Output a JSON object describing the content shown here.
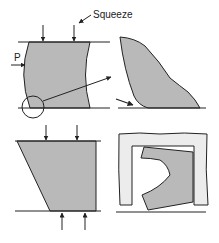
{
  "labels": {
    "squeeze": "Squeeze",
    "force_p": "P"
  },
  "colors": {
    "material_fill": "#b9b9b9",
    "die_fill": "#ececec",
    "stroke": "#222222",
    "background": "#ffffff"
  },
  "panels": [
    {
      "id": "barrel-compression",
      "description": "Barrelled workpiece squeezed between parallel platens with lateral force P and circled corner detail"
    },
    {
      "id": "corner-detail",
      "description": "Enlarged view of the bulging corner folding onto the platen"
    },
    {
      "id": "tapered-compression",
      "description": "Tapered workpiece compressed from top and bottom"
    },
    {
      "id": "die-cavity",
      "description": "Workpiece deformed inside a die cavity frame"
    }
  ]
}
